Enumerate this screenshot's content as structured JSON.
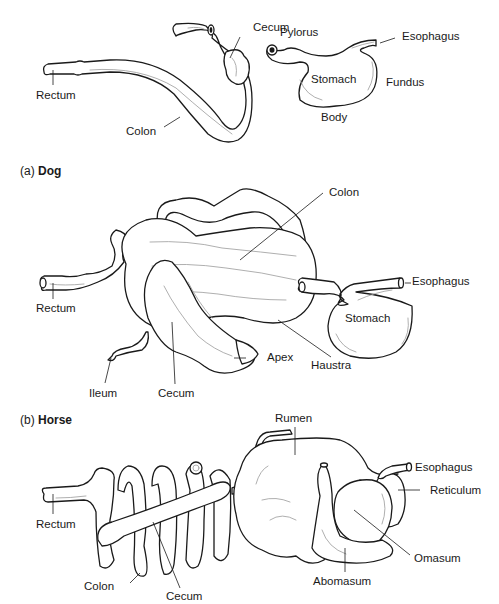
{
  "figure": {
    "panels": [
      {
        "id": "dog",
        "caption_letter": "(a)",
        "caption_name": "Dog",
        "labels": {
          "cecum": "Cecum",
          "rectum": "Rectum",
          "colon": "Colon",
          "pylorus": "Pylorus",
          "esophagus": "Esophagus",
          "stomach": "Stomach",
          "fundus": "Fundus",
          "body": "Body"
        }
      },
      {
        "id": "horse",
        "caption_letter": "(b)",
        "caption_name": "Horse",
        "labels": {
          "colon": "Colon",
          "rectum": "Rectum",
          "esophagus": "Esophagus",
          "stomach": "Stomach",
          "apex": "Apex",
          "haustra": "Haustra",
          "ileum": "Ileum",
          "cecum": "Cecum"
        }
      },
      {
        "id": "ruminant",
        "labels": {
          "rumen": "Rumen",
          "esophagus": "Esophagus",
          "reticulum": "Reticulum",
          "rectum": "Rectum",
          "omasum": "Omasum",
          "abomasum": "Abomasum",
          "colon": "Colon",
          "cecum": "Cecum"
        }
      }
    ]
  },
  "colors": {
    "line": "#1a1a1a",
    "shade": "#9a9a9a",
    "background": "#ffffff"
  }
}
